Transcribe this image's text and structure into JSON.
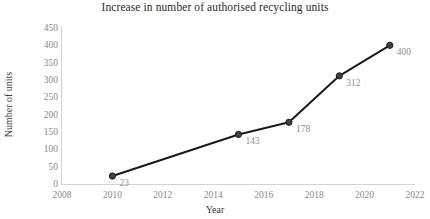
{
  "chart_data": {
    "type": "line",
    "title": "Increase in number of authorised recycling units",
    "xlabel": "Year",
    "ylabel": "Number of units",
    "x": [
      2010,
      2015,
      2017,
      2019,
      2021
    ],
    "values": [
      23,
      143,
      178,
      312,
      400
    ],
    "point_labels": [
      "23",
      "143",
      "178",
      "312",
      "400"
    ],
    "xlim": [
      2008,
      2022
    ],
    "ylim": [
      0,
      450
    ],
    "xticks": [
      "2008",
      "2010",
      "2012",
      "2014",
      "2016",
      "2018",
      "2020",
      "2022"
    ],
    "yticks": [
      "0",
      "50",
      "100",
      "150",
      "200",
      "250",
      "300",
      "350",
      "400",
      "450"
    ],
    "grid": false,
    "legend": "none",
    "marker": "filled-circle",
    "line_color": "#1a1a1a",
    "marker_color": "#3f3f3f",
    "label_color": "#8f8f8f",
    "axis_color": "#d4d4d4",
    "background": "#ffffff"
  }
}
